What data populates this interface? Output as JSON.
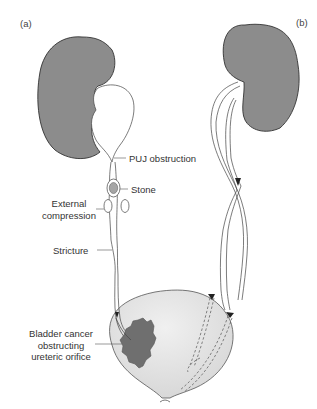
{
  "figure": {
    "panels": [
      {
        "id": "a",
        "label": "(a)"
      },
      {
        "id": "b",
        "label": "(b)"
      }
    ],
    "labels": {
      "puj": "PUJ obstruction",
      "stone": "Stone",
      "external_line1": "External",
      "external_line2": "compression",
      "stricture": "Stricture",
      "bladder_line1": "Bladder cancer",
      "bladder_line2": "obstructing",
      "bladder_line3": "ureteric orifice"
    },
    "colors": {
      "kidney": "#8c8c8c",
      "bladder": "#e2e2e2",
      "tumour": "#6f6f6f",
      "stone": "#a5a5a5",
      "outline": "#333333"
    }
  }
}
